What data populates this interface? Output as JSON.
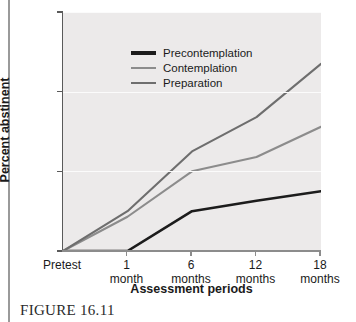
{
  "chart_data": {
    "type": "line",
    "title": "",
    "xlabel": "Assessment periods",
    "ylabel": "Percent abstinent",
    "categories": [
      "Pretest",
      "1 month",
      "6 months",
      "12 months",
      "18 months"
    ],
    "category_lines": [
      [
        "Pretest",
        ""
      ],
      [
        "1",
        "month"
      ],
      [
        "6",
        "months"
      ],
      [
        "12",
        "months"
      ],
      [
        "18",
        "months"
      ]
    ],
    "ylim": [
      0,
      30
    ],
    "yticks": [
      0,
      10,
      20,
      30
    ],
    "ytick_labels": [
      "0",
      "10",
      "20",
      "30"
    ],
    "grid": "horizontal",
    "legend_position": "top-left",
    "series": [
      {
        "name": "Precontemplation",
        "color": "#1c1c1c",
        "values": [
          0,
          0,
          5.0,
          6.3,
          7.5
        ]
      },
      {
        "name": "Contemplation",
        "color": "#8c8c8c",
        "values": [
          0,
          4.3,
          10.0,
          11.8,
          15.6
        ]
      },
      {
        "name": "Preparation",
        "color": "#6e6e6e",
        "values": [
          0,
          5.0,
          12.5,
          16.8,
          23.5
        ]
      }
    ]
  },
  "caption": {
    "text": "FIGURE 16.11"
  },
  "colors": {
    "plot_background": "#eceaea",
    "gridline": "#fbfbfb",
    "axis": "#8c8c8c"
  }
}
